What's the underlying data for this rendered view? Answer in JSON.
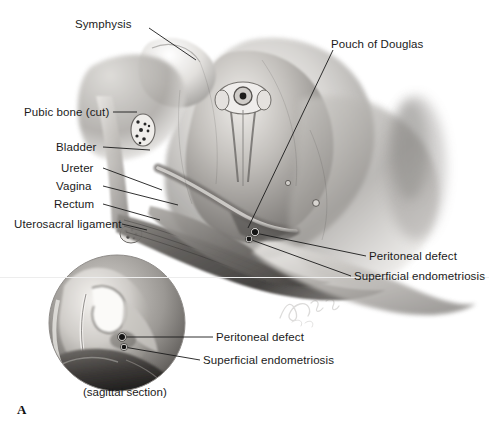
{
  "figure": {
    "panel_letter": "A",
    "caption": "(sagittal section)",
    "signature": "artist-signature"
  },
  "colors": {
    "label_text": "#1b1b1b",
    "leader_line": "#1a1a1a",
    "background": "#ffffff",
    "tissue_light": "#f2f1ef",
    "tissue_mid": "#b9b7b4",
    "tissue_dark": "#5e5c5a",
    "tissue_deep": "#2e2d2c",
    "hairline": "#ededed",
    "lesion": "#141414"
  },
  "labels": {
    "main": [
      {
        "id": "symphysis",
        "text": "Symphysis",
        "x": 75,
        "y": 18,
        "align": "left",
        "leader": [
          [
            149,
            28
          ],
          [
            196,
            60
          ]
        ]
      },
      {
        "id": "pubic-bone-cut",
        "text": "Pubic bone (cut)",
        "x": 24,
        "y": 106,
        "align": "left",
        "leader": [
          [
            113,
            112
          ],
          [
            137,
            112
          ]
        ]
      },
      {
        "id": "bladder",
        "text": "Bladder",
        "x": 56,
        "y": 141,
        "align": "left",
        "leader": [
          [
            103,
            147
          ],
          [
            150,
            150
          ]
        ]
      },
      {
        "id": "ureter",
        "text": "Ureter",
        "x": 61,
        "y": 162,
        "align": "left",
        "leader": [
          [
            103,
            168
          ],
          [
            162,
            190
          ]
        ]
      },
      {
        "id": "vagina",
        "text": "Vagina",
        "x": 56,
        "y": 180,
        "align": "left",
        "leader": [
          [
            103,
            186
          ],
          [
            178,
            205
          ]
        ]
      },
      {
        "id": "rectum",
        "text": "Rectum",
        "x": 54,
        "y": 198,
        "align": "left",
        "leader": [
          [
            103,
            204
          ],
          [
            160,
            220
          ]
        ]
      },
      {
        "id": "uterosacral-ligament",
        "text": "Uterosacral ligament",
        "x": 14,
        "y": 218,
        "align": "left",
        "leader": [
          [
            122,
            224
          ],
          [
            147,
            230
          ]
        ]
      },
      {
        "id": "pouch-of-douglas",
        "text": "Pouch of Douglas",
        "x": 331,
        "y": 38,
        "align": "left",
        "leader": [
          [
            333,
            50
          ],
          [
            248,
            228
          ]
        ]
      },
      {
        "id": "peritoneal-defect-main",
        "text": "Peritoneal defect",
        "x": 369,
        "y": 250,
        "align": "left",
        "leader": [
          [
            366,
            256
          ],
          [
            255,
            233
          ]
        ]
      },
      {
        "id": "superficial-endometriosis-main",
        "text": "Superficial endometriosis",
        "x": 354,
        "y": 270,
        "align": "left",
        "leader": [
          [
            351,
            276
          ],
          [
            249,
            239
          ]
        ]
      }
    ],
    "inset": [
      {
        "id": "peritoneal-defect-inset",
        "text": "Peritoneal defect",
        "x": 216,
        "y": 331,
        "align": "left",
        "leader": [
          [
            213,
            337
          ],
          [
            122,
            337
          ]
        ]
      },
      {
        "id": "superficial-endometriosis-inset",
        "text": "Superficial endometriosis",
        "x": 203,
        "y": 354,
        "align": "left",
        "leader": [
          [
            200,
            360
          ],
          [
            124,
            347
          ]
        ]
      }
    ]
  },
  "inset_circle": {
    "cx": 117,
    "cy": 323,
    "r": 68
  },
  "lesion_markers": [
    {
      "id": "lesion-main-upper",
      "x": 255,
      "y": 232,
      "r": 3.1
    },
    {
      "id": "lesion-main-lower",
      "x": 249,
      "y": 239,
      "r": 2.4
    },
    {
      "id": "lesion-inset-upper",
      "x": 122,
      "y": 337,
      "r": 3.0
    },
    {
      "id": "lesion-inset-lower",
      "x": 124,
      "y": 347,
      "r": 2.3
    }
  ],
  "hairline_y": 277
}
